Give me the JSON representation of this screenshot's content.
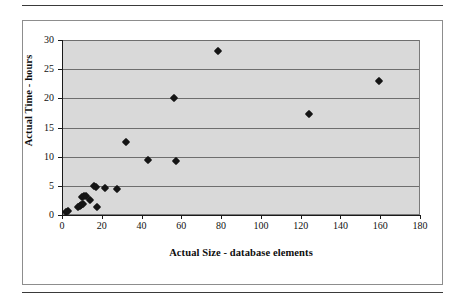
{
  "figure": {
    "frame": {
      "top_rule": "",
      "bottom_rule": ""
    }
  },
  "chart_data": {
    "type": "scatter",
    "title": "",
    "xlabel": "Actual Size - database elements",
    "ylabel": "Actual Time - hours",
    "xlim": [
      0,
      180
    ],
    "ylim": [
      0,
      30
    ],
    "xticks": [
      0,
      20,
      40,
      60,
      80,
      100,
      120,
      140,
      160,
      180
    ],
    "yticks": [
      0,
      5,
      10,
      15,
      20,
      25,
      30
    ],
    "xtick_labels": [
      "0",
      "20",
      "40",
      "60",
      "80",
      "100",
      "120",
      "140",
      "160",
      "180"
    ],
    "ytick_labels": [
      "0",
      "5",
      "10",
      "15",
      "20",
      "25",
      "30"
    ],
    "grid": {
      "horizontal": true,
      "vertical": false
    },
    "legend": null,
    "plot_background": "#d9d9d9",
    "marker_color": "#151515",
    "marker_shape": "diamond",
    "points": [
      {
        "x": 2.0,
        "y": 0.5
      },
      {
        "x": 3.0,
        "y": 0.7
      },
      {
        "x": 8.0,
        "y": 1.4
      },
      {
        "x": 9.0,
        "y": 1.5
      },
      {
        "x": 9.5,
        "y": 1.8
      },
      {
        "x": 10.5,
        "y": 1.9
      },
      {
        "x": 10.0,
        "y": 3.1
      },
      {
        "x": 11.0,
        "y": 3.3
      },
      {
        "x": 12.0,
        "y": 3.3
      },
      {
        "x": 14.0,
        "y": 2.5
      },
      {
        "x": 16.0,
        "y": 4.9
      },
      {
        "x": 17.0,
        "y": 4.8
      },
      {
        "x": 17.5,
        "y": 1.3
      },
      {
        "x": 21.5,
        "y": 4.6
      },
      {
        "x": 27.5,
        "y": 4.5
      },
      {
        "x": 32.0,
        "y": 12.6
      },
      {
        "x": 43.0,
        "y": 9.5
      },
      {
        "x": 57.5,
        "y": 9.3
      },
      {
        "x": 56.5,
        "y": 20.0
      },
      {
        "x": 78.5,
        "y": 28.1
      },
      {
        "x": 124.0,
        "y": 17.3
      },
      {
        "x": 159.5,
        "y": 23.0
      }
    ]
  }
}
